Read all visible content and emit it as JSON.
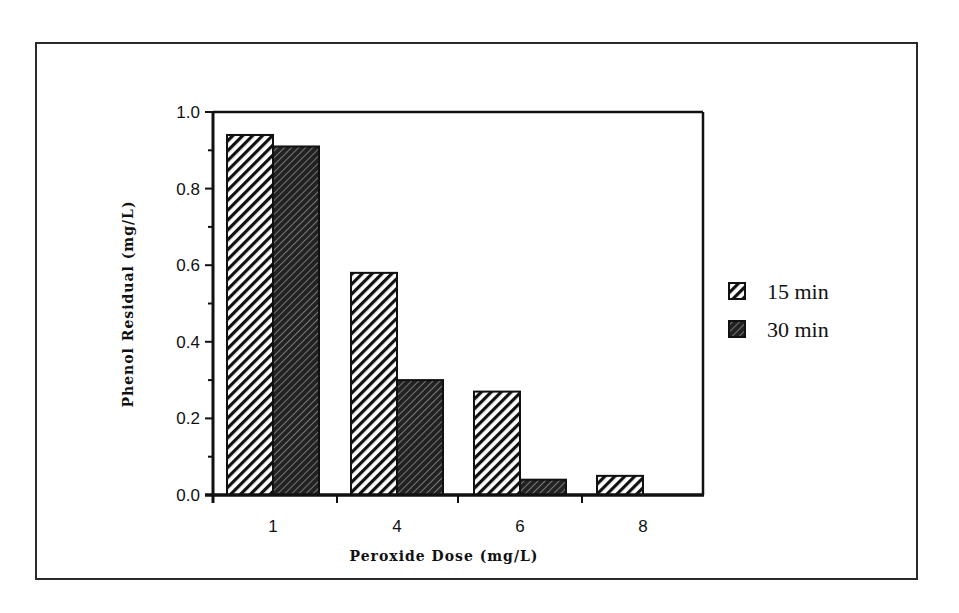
{
  "chart_data": {
    "type": "bar",
    "title": "",
    "xlabel": "Peroxide Dose (mg/L)",
    "ylabel": "Phenol Residual (mg/L)",
    "categories": [
      "1",
      "4",
      "6",
      "8"
    ],
    "series": [
      {
        "name": "15 min",
        "values": [
          0.94,
          0.58,
          0.27,
          0.05
        ],
        "pattern": "light-diagonal-hatch"
      },
      {
        "name": "30 min",
        "values": [
          0.91,
          0.3,
          0.04,
          0.0
        ],
        "pattern": "dark-crosshatch"
      }
    ],
    "ylim": [
      0.0,
      1.0
    ],
    "yticks": [
      "0.0",
      "0.2",
      "0.4",
      "0.6",
      "0.8",
      "1.0"
    ],
    "grid": false,
    "legend_position": "right"
  },
  "colors": {
    "ink": "#111111",
    "frame": "#2a2a2a",
    "background": "#ffffff"
  }
}
